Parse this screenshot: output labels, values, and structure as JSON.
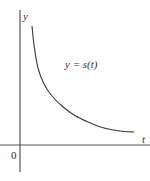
{
  "chart_data": {
    "type": "line",
    "title": "",
    "xlabel": "t",
    "ylabel": "y",
    "origin_label": "0",
    "annotations": [
      "y = s(t)"
    ],
    "series": [
      {
        "name": "y = s(t)",
        "description": "decreasing, concave-up curve approaching the t-axis",
        "points_px": [
          [
            32,
            26
          ],
          [
            34,
            45
          ],
          [
            38,
            68
          ],
          [
            44,
            84
          ],
          [
            52,
            96
          ],
          [
            62,
            106
          ],
          [
            74,
            115
          ],
          [
            88,
            122
          ],
          [
            104,
            128
          ],
          [
            120,
            131
          ],
          [
            134,
            132
          ]
        ]
      }
    ],
    "grid": false,
    "legend": "none",
    "colors": {
      "axis": "#555555",
      "curve": "#3a3a3a",
      "text": "#333333"
    }
  },
  "labels": {
    "y_axis": "y",
    "x_axis": "t",
    "origin": "0",
    "curve": "y = s(t)"
  }
}
